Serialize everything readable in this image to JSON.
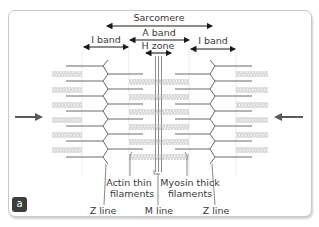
{
  "figure": {
    "panel_label": "a",
    "labels": {
      "sarcomere": "Sarcomere",
      "a_band": "A band",
      "h_zone": "H zone",
      "i_band_left": "I band",
      "i_band_right": "I band",
      "actin_line1": "Actin thin",
      "actin_line2": "filaments",
      "myosin_line1": "Myosin thick",
      "myosin_line2": "filaments",
      "z_line_left": "Z line",
      "m_line": "M line",
      "z_line_right": "Z line"
    },
    "colors": {
      "line": "#6b6b6b",
      "dark": "#1a1a1a",
      "myosin": "#b8b8b8",
      "arrow": "#5a5a5a",
      "badge": "#3d3d3d"
    }
  }
}
